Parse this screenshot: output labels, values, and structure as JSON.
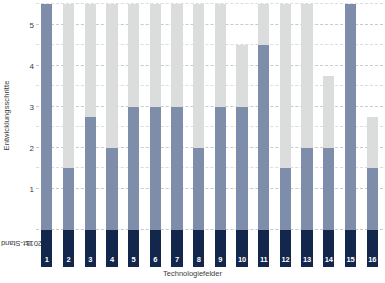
{
  "chart_data": {
    "type": "bar",
    "title": "",
    "subtitle": "",
    "xlabel": "Technologiefelder",
    "ylabel": "Entwicklungsschritte",
    "baseline_label": "Ist-Stand\n2011",
    "baseline_label_line1": "Ist-Stand",
    "baseline_label_line2": "2011",
    "categories": [
      "1",
      "2",
      "3",
      "4",
      "5",
      "6",
      "7",
      "8",
      "9",
      "10",
      "11",
      "12",
      "13",
      "14",
      "15",
      "16"
    ],
    "ylim": [
      0,
      5.5
    ],
    "yticks": [
      1,
      2,
      3,
      4,
      5
    ],
    "ytick_labels": [
      "1",
      "2",
      "3",
      "4",
      "5"
    ],
    "minor_yticks": [
      1.5,
      2.5,
      3.5,
      4.5,
      5.5
    ],
    "grid": true,
    "legend": "none",
    "stacked": true,
    "series": [
      {
        "name": "Entwicklungsschritte",
        "color": "#7d8daa",
        "values": [
          5.5,
          1.5,
          2.75,
          2.0,
          3.0,
          3.0,
          3.0,
          2.0,
          3.0,
          3.0,
          4.5,
          1.5,
          2.0,
          2.0,
          5.5,
          1.5
        ]
      },
      {
        "name": "Potenzial",
        "color": "#dbdcdc",
        "values": [
          5.5,
          5.5,
          5.5,
          5.5,
          5.5,
          5.5,
          5.5,
          5.5,
          5.5,
          4.5,
          5.5,
          5.5,
          5.5,
          3.75,
          5.5,
          2.75
        ]
      }
    ],
    "colors": {
      "baseline": "#13264b",
      "value": "#7d8daa",
      "remainder": "#dbdcdc",
      "gridline": "#b9c2cf",
      "background": "#ffffff",
      "text": "#3c3c3c",
      "label_text": "#ffffff"
    }
  }
}
